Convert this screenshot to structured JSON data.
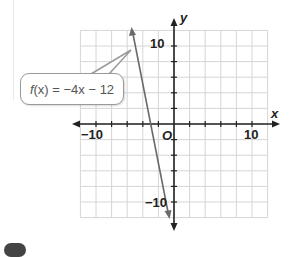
{
  "chart_data": {
    "type": "line",
    "title": "",
    "xlabel": "x",
    "ylabel": "y",
    "xlim": [
      -12,
      12
    ],
    "ylim": [
      -12,
      12
    ],
    "grid": true,
    "grid_spacing": 2,
    "x_tick_labels": [
      "-10",
      "10"
    ],
    "y_tick_labels": [
      "10",
      "-10"
    ],
    "origin_label": "O",
    "series": [
      {
        "name": "f(x) = -4x - 12",
        "equation": "f(x) = -4x - 12",
        "slope": -4,
        "intercept": -12,
        "x": [
          -5.25,
          -0.75
        ],
        "y": [
          9,
          -9
        ],
        "color": "#666666"
      }
    ],
    "annotations": [
      {
        "text": "f(x) = −4x − 12",
        "type": "callout",
        "points_to": [
          -4.6,
          6.4
        ]
      }
    ]
  },
  "labels": {
    "callout_fn": "f",
    "callout_rest": "(x) = −4x − 12",
    "x_axis": "x",
    "y_axis": "y",
    "origin": "O",
    "x_neg10": "−10",
    "x_pos10": "10",
    "y_pos10": "10",
    "y_neg10": "−10"
  },
  "colors": {
    "grid": "#d4d4d4",
    "axis": "#222222",
    "line": "#6a6a6a",
    "callout_border": "#9a9a9a"
  }
}
